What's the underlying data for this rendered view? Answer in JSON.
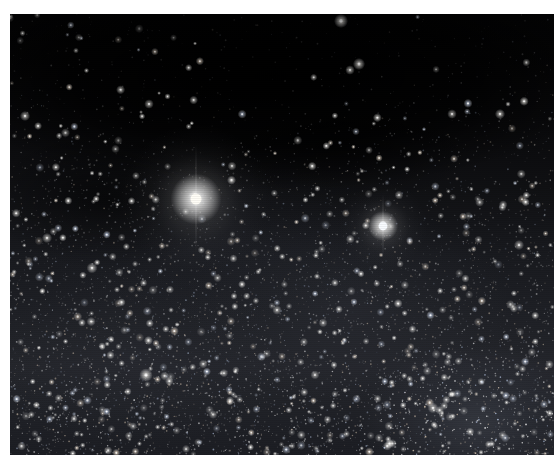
{
  "image": {
    "title": "Alpha and Beta Centauri star field",
    "kind": "astrophotograph",
    "width": 554,
    "height": 468,
    "background_color": "#ffffff",
    "sky_color": "#000000"
  },
  "frame": {
    "content_left": 10,
    "content_top": 14,
    "content_width": 544,
    "content_height": 441,
    "border_top": 14,
    "border_left": 10,
    "border_bottom": 13,
    "border_right": 0,
    "border_color": "#ffffff"
  },
  "sky": {
    "base_color": "#050506",
    "milky_way": {
      "description": "diffuse glow band brightening toward lower half",
      "glow_color": "#2a2c33",
      "band_center_y": 0.72,
      "band_thickness": 0.55,
      "tilt_degrees": -8
    },
    "dark_nebula": {
      "description": "darker dust lane across the upper third",
      "color": "#000000",
      "center_x": 0.48,
      "center_y": 0.14,
      "radius_x": 0.62,
      "radius_y": 0.26
    },
    "star_cloud": {
      "description": "brighter star cloud toward lower right",
      "color": "#44474f",
      "center_x": 0.86,
      "center_y": 0.93,
      "radius_x": 0.22,
      "radius_y": 0.18
    },
    "faint_star_count": 9000,
    "mid_star_count": 1400,
    "star_color": "#ffffff",
    "star_tint_warm": "#ffe9cf",
    "star_tint_cool": "#cfe0ff"
  },
  "bright_stars": [
    {
      "name": "Alpha Centauri",
      "x": 196,
      "y": 199,
      "core_radius": 5.5,
      "glow_radius": 34,
      "brightness": 1.0,
      "color": "#fffdf6",
      "glow_color": "#d8d4c8"
    },
    {
      "name": "Beta Centauri",
      "x": 383,
      "y": 226,
      "core_radius": 4.4,
      "glow_radius": 20,
      "brightness": 0.92,
      "color": "#f8fbff",
      "glow_color": "#c4cdd8"
    }
  ],
  "notable_stars": [
    {
      "x": 341,
      "y": 21,
      "radius": 2.2,
      "brightness": 0.85
    },
    {
      "x": 359,
      "y": 64,
      "radius": 1.9,
      "brightness": 0.78
    },
    {
      "x": 350,
      "y": 70,
      "radius": 1.5,
      "brightness": 0.7
    },
    {
      "x": 25,
      "y": 116,
      "radius": 1.6,
      "brightness": 0.66
    },
    {
      "x": 149,
      "y": 104,
      "radius": 1.5,
      "brightness": 0.64
    },
    {
      "x": 452,
      "y": 114,
      "radius": 1.5,
      "brightness": 0.62
    },
    {
      "x": 500,
      "y": 114,
      "radius": 1.6,
      "brightness": 0.68
    },
    {
      "x": 47,
      "y": 238,
      "radius": 1.6,
      "brightness": 0.66
    },
    {
      "x": 92,
      "y": 268,
      "radius": 1.7,
      "brightness": 0.7
    },
    {
      "x": 146,
      "y": 375,
      "radius": 2.1,
      "brightness": 0.82
    },
    {
      "x": 277,
      "y": 310,
      "radius": 1.5,
      "brightness": 0.62
    },
    {
      "x": 433,
      "y": 408,
      "radius": 1.7,
      "brightness": 0.7
    },
    {
      "x": 519,
      "y": 245,
      "radius": 1.6,
      "brightness": 0.64
    },
    {
      "x": 232,
      "y": 166,
      "radius": 1.4,
      "brightness": 0.6
    },
    {
      "x": 399,
      "y": 195,
      "radius": 1.4,
      "brightness": 0.58
    }
  ]
}
